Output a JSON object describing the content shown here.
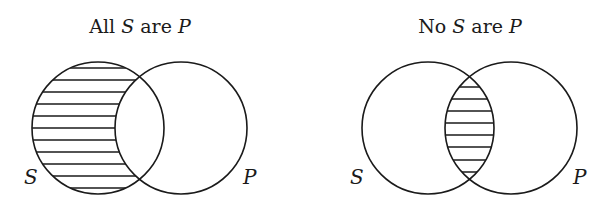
{
  "diagrams": [
    {
      "id": "all-s-are-p",
      "title": {
        "prefix": "All ",
        "subject": "S",
        "mid": " are ",
        "predicate": "P"
      },
      "circle_labels": {
        "left": "S",
        "right": "P"
      },
      "shaded_region": "S outside P",
      "circles": {
        "left": {
          "cx": 98,
          "cy": 128,
          "r": 66
        },
        "right": {
          "cx": 181,
          "cy": 128,
          "r": 66
        }
      }
    },
    {
      "id": "no-s-are-p",
      "title": {
        "prefix": "No ",
        "subject": "S",
        "mid": " are ",
        "predicate": "P"
      },
      "circle_labels": {
        "left": "S",
        "right": "P"
      },
      "shaded_region": "S and P intersection",
      "circles": {
        "left": {
          "cx": 428,
          "cy": 128,
          "r": 66
        },
        "right": {
          "cx": 511,
          "cy": 128,
          "r": 66
        }
      }
    }
  ],
  "colors": {
    "ink": "#1a1a1a",
    "background": "#ffffff"
  }
}
